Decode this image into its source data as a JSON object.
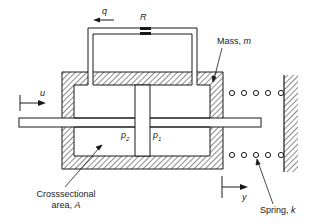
{
  "diagram": {
    "type": "hydraulic-mass-spring system",
    "labels": {
      "flow": "q",
      "restriction": "R",
      "mass_prefix": "Mass, ",
      "mass_symbol": "m",
      "input_displacement": "u",
      "pressure_left": "p",
      "pressure_left_sub": "2",
      "pressure_right": "p",
      "pressure_right_sub": "1",
      "area_line1": "Crosssectional",
      "area_line2_prefix": "area, ",
      "area_symbol": "A",
      "output_displacement": "y",
      "spring_prefix": "Spring, ",
      "spring_symbol": "k"
    },
    "components": [
      "bypass pipe with flow q",
      "flow restriction R",
      "hatched housing (mass m)",
      "piston rod",
      "piston",
      "spring k (coils)",
      "fixed wall"
    ],
    "colors": {
      "line": "#1a1a1a",
      "background": "#ffffff"
    }
  }
}
